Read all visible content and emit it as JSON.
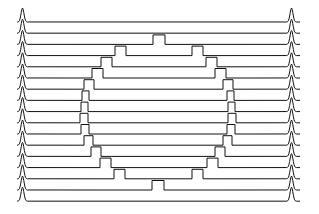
{
  "figure": {
    "title": "",
    "background_color": "#ffffff",
    "trace_color": "#111111",
    "width": 319,
    "height": 214
  },
  "chart_data": {
    "type": "line",
    "title": "",
    "subtitle": "",
    "xlabel": "",
    "ylabel": "",
    "legend": [],
    "legend_position": "none",
    "grid": false,
    "xlim": [
      0,
      319
    ],
    "ylim": [
      0,
      214
    ],
    "axes_visible": false,
    "tick_labels_x": [],
    "tick_labels_y": [],
    "layout": {
      "trace_count": 17,
      "first_baseline_y": 22,
      "row_spacing": 11.2,
      "plot_left_x": 18,
      "plot_right_x": 300,
      "edge_peak_left_x": 22.5,
      "edge_peak_right_x": 291.5,
      "edge_peak_height": 14,
      "edge_peak_half_width": 5,
      "pulse_height": 9.5,
      "stroke_width": 1
    },
    "series": [
      {
        "name": "trace-1",
        "baseline_y": 22.0,
        "pulses": []
      },
      {
        "name": "trace-2",
        "baseline_y": 33.2,
        "pulses": []
      },
      {
        "name": "trace-3",
        "baseline_y": 44.4,
        "pulses": [
          {
            "x0": 153,
            "x1": 165
          }
        ]
      },
      {
        "name": "trace-4",
        "baseline_y": 55.6,
        "pulses": [
          {
            "x0": 115,
            "x1": 126
          },
          {
            "x0": 192,
            "x1": 203
          }
        ]
      },
      {
        "name": "trace-5",
        "baseline_y": 66.8,
        "pulses": [
          {
            "x0": 101,
            "x1": 112
          },
          {
            "x0": 206,
            "x1": 217
          }
        ]
      },
      {
        "name": "trace-6",
        "baseline_y": 78.0,
        "pulses": [
          {
            "x0": 92,
            "x1": 103
          },
          {
            "x0": 215,
            "x1": 226
          }
        ]
      },
      {
        "name": "trace-7",
        "baseline_y": 89.2,
        "pulses": [
          {
            "x0": 84,
            "x1": 94
          },
          {
            "x0": 223,
            "x1": 233
          }
        ]
      },
      {
        "name": "trace-8",
        "baseline_y": 100.4,
        "pulses": [
          {
            "x0": 82,
            "x1": 89
          },
          {
            "x0": 227,
            "x1": 234
          }
        ]
      },
      {
        "name": "trace-9",
        "baseline_y": 111.6,
        "pulses": [
          {
            "x0": 81,
            "x1": 88
          },
          {
            "x0": 228,
            "x1": 235
          }
        ]
      },
      {
        "name": "trace-10",
        "baseline_y": 122.8,
        "pulses": [
          {
            "x0": 80,
            "x1": 88
          },
          {
            "x0": 228,
            "x1": 236
          }
        ]
      },
      {
        "name": "trace-11",
        "baseline_y": 134.0,
        "pulses": [
          {
            "x0": 81,
            "x1": 89
          },
          {
            "x0": 227,
            "x1": 235
          }
        ]
      },
      {
        "name": "trace-12",
        "baseline_y": 145.2,
        "pulses": [
          {
            "x0": 84,
            "x1": 93
          },
          {
            "x0": 223,
            "x1": 232
          }
        ]
      },
      {
        "name": "trace-13",
        "baseline_y": 156.4,
        "pulses": [
          {
            "x0": 91,
            "x1": 101
          },
          {
            "x0": 215,
            "x1": 225
          }
        ]
      },
      {
        "name": "trace-14",
        "baseline_y": 167.6,
        "pulses": [
          {
            "x0": 100,
            "x1": 111
          },
          {
            "x0": 207,
            "x1": 218
          }
        ]
      },
      {
        "name": "trace-15",
        "baseline_y": 178.8,
        "pulses": [
          {
            "x0": 114,
            "x1": 125
          },
          {
            "x0": 192,
            "x1": 203
          }
        ]
      },
      {
        "name": "trace-16",
        "baseline_y": 190.0,
        "pulses": [
          {
            "x0": 152,
            "x1": 164
          }
        ]
      },
      {
        "name": "trace-17",
        "baseline_y": 201.2,
        "pulses": []
      }
    ]
  }
}
